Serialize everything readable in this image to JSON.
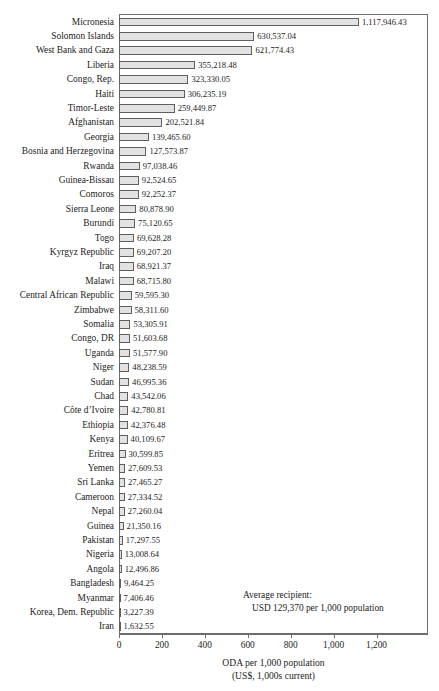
{
  "chart_data": {
    "type": "bar",
    "orientation": "horizontal",
    "title": "",
    "xlabel": "ODA per 1,000 population",
    "xlabel_line2": "(US$, 1,000s current)",
    "ylabel": "",
    "xlim": [
      0,
      1440
    ],
    "xticks": [
      0,
      200,
      400,
      600,
      800,
      1000,
      1200
    ],
    "xtick_labels": [
      "0",
      "200",
      "400",
      "600",
      "800",
      "1,000",
      "1,200"
    ],
    "grid": false,
    "legend": "none",
    "bar_fill": "#e2e2e2",
    "bar_edge": "#5f5f5f",
    "categories": [
      "Micronesia",
      "Solomon Islands",
      "West Bank and Gaza",
      "Liberia",
      "Congo, Rep.",
      "Haiti",
      "Timor-Leste",
      "Afghanistan",
      "Georgia",
      "Bosnia and Herzegovina",
      "Rwanda",
      "Guinea-Bissau",
      "Comoros",
      "Sierra Leone",
      "Burundi",
      "Togo",
      "Kyrgyz Republic",
      "Iraq",
      "Malawi",
      "Central African Republic",
      "Zimbabwe",
      "Somalia",
      "Congo, DR",
      "Uganda",
      "Niger",
      "Sudan",
      "Chad",
      "Côte d’Ivoire",
      "Ethiopia",
      "Kenya",
      "Eritrea",
      "Yemen",
      "Sri Lanka",
      "Cameroon",
      "Nepal",
      "Guinea",
      "Pakistan",
      "Nigeria",
      "Angola",
      "Bangladesh",
      "Myanmar",
      "Korea, Dem. Republic",
      "Iran"
    ],
    "values": [
      1117.94643,
      630.53704,
      621.77443,
      355.21848,
      323.33005,
      306.23519,
      259.44987,
      202.52184,
      139.4656,
      127.57387,
      97.03846,
      92.52465,
      92.25237,
      80.8789,
      75.12065,
      69.62828,
      69.2072,
      68.92137,
      68.7158,
      59.5953,
      58.3116,
      53.30591,
      51.60368,
      51.5779,
      48.23859,
      46.99536,
      43.54206,
      42.78081,
      42.37648,
      40.10967,
      30.59985,
      27.60953,
      27.46527,
      27.33452,
      27.26004,
      21.35016,
      17.29755,
      13.00864,
      12.49686,
      9.46425,
      7.40646,
      3.22739,
      1.63255
    ],
    "value_labels": [
      "1,117,946.43",
      "630,537.04",
      "621,774.43",
      "355,218.48",
      "323,330.05",
      "306,235.19",
      "259,449.87",
      "202,521.84",
      "139,465.60",
      "127,573.87",
      "97,038.46",
      "92,524.65",
      "92,252.37",
      "80,878.90",
      "75,120.65",
      "69,628.28",
      "69,207.20",
      "68,921.37",
      "68,715.80",
      "59,595.30",
      "58,311.60",
      "53,305.91",
      "51,603.68",
      "51,577.90",
      "48,238.59",
      "46,995.36",
      "43,542.06",
      "42,780.81",
      "42,376.48",
      "40,109.67",
      "30,599.85",
      "27,609.53",
      "27,465.27",
      "27,334.52",
      "27,260.04",
      "21,350.16",
      "17,297.55",
      "13,008.64",
      "12,496.86",
      "9,464.25",
      "7,406.46",
      "3,227.39",
      "1,632.55"
    ],
    "annotations": [
      {
        "line1": "Average recipient:",
        "line2": "USD 129,370 per 1,000 population"
      }
    ]
  }
}
